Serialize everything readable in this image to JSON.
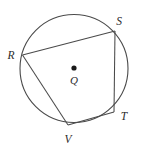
{
  "figure": {
    "type": "circle-inscribed-quadrilateral",
    "background_color": "#ffffff",
    "stroke_color": "#4a4a4a",
    "label_color": "#2b2b2b",
    "circle": {
      "center_label": "Q",
      "center_x": 74,
      "center_y": 68.5,
      "radius": 54,
      "stroke_width": 1.1
    },
    "center_point": {
      "name": "Q",
      "x": 74,
      "y": 68,
      "dot_radius": 2.6,
      "label": "Q",
      "label_x": 74,
      "label_y": 81
    },
    "vertices": [
      {
        "name": "R",
        "label": "R",
        "x": 22.5,
        "y": 55.0,
        "label_x": 11,
        "label_y": 56
      },
      {
        "name": "S",
        "label": "S",
        "x": 115.0,
        "y": 31.0,
        "label_x": 119,
        "label_y": 22
      },
      {
        "name": "T",
        "label": "T",
        "x": 114.0,
        "y": 112.0,
        "label_x": 124,
        "label_y": 117
      },
      {
        "name": "V",
        "label": "V",
        "x": 68.0,
        "y": 125.0,
        "label_x": 68,
        "label_y": 140
      }
    ],
    "chords": [
      {
        "name": "chord-RS",
        "from": "R",
        "to": "S"
      },
      {
        "name": "chord-ST",
        "from": "S",
        "to": "T"
      },
      {
        "name": "chord-TV",
        "from": "T",
        "to": "V"
      },
      {
        "name": "chord-VR",
        "from": "V",
        "to": "R"
      }
    ]
  }
}
